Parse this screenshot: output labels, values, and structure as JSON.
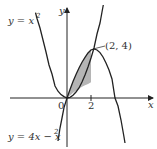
{
  "diagram": {
    "title": "",
    "curves": [
      {
        "name": "parabola-upper",
        "equation_label": "y = x",
        "exponent": "2",
        "expression": "y = x^2"
      },
      {
        "name": "parabola-lower",
        "equation_label": "y = 4x − x",
        "exponent": "2",
        "expression": "y = 4x - x^2"
      }
    ],
    "axes": {
      "x_label": "x",
      "y_label": "y",
      "origin_label": "0",
      "x_tick_label": "2"
    },
    "point_label": "(2, 4)",
    "shaded_region": "area between curves from x=0 to x=2",
    "colors": {
      "stroke": "#222222",
      "shade": "#b5b5b5",
      "text": "#333333"
    }
  }
}
